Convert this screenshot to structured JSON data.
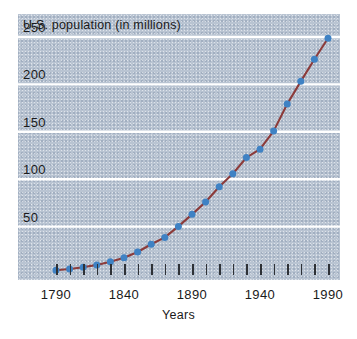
{
  "chart_data": {
    "type": "line",
    "title": "U.S. population (in millions)",
    "xlabel": "Years",
    "ylabel": "",
    "xlim": [
      1790,
      1990
    ],
    "ylim": [
      0,
      270
    ],
    "grid": true,
    "legend": false,
    "y_ticks": [
      50,
      100,
      150,
      200,
      250
    ],
    "x_ticks": [
      1790,
      1800,
      1810,
      1820,
      1830,
      1840,
      1850,
      1860,
      1870,
      1880,
      1890,
      1900,
      1910,
      1920,
      1930,
      1940,
      1950,
      1960,
      1970,
      1980,
      1990
    ],
    "x_tick_labels": [
      "1790",
      "1840",
      "1890",
      "1940",
      "1990"
    ],
    "x_tick_label_values": [
      1790,
      1840,
      1890,
      1940,
      1990
    ],
    "x": [
      1790,
      1800,
      1810,
      1820,
      1830,
      1840,
      1850,
      1860,
      1870,
      1880,
      1890,
      1900,
      1910,
      1920,
      1930,
      1940,
      1950,
      1960,
      1970,
      1980,
      1990
    ],
    "values": [
      3.9,
      5.3,
      7.2,
      9.6,
      12.9,
      17.1,
      23.2,
      31.4,
      38.6,
      50.2,
      62.9,
      76.0,
      92.0,
      105.7,
      122.8,
      131.7,
      150.7,
      179.3,
      203.2,
      226.5,
      248.7
    ],
    "marker_color": "#3f82c4",
    "line_color": "#8c3b3a",
    "panel_color": "#b9c4d2",
    "gridline_color": "#ffffff",
    "text_color": "#1a1a1a"
  },
  "axes": {
    "y_tick_labels": [
      "250",
      "200",
      "150",
      "100",
      "50"
    ],
    "x_tick_labels": [
      "1790",
      "1840",
      "1890",
      "1940",
      "1990"
    ]
  }
}
